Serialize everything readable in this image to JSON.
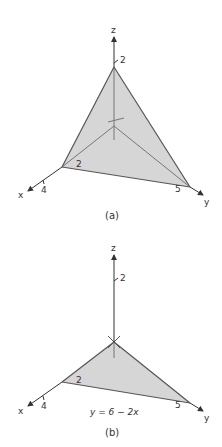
{
  "figure_a": {
    "caption": "(a)",
    "axes": {
      "x_label": "x",
      "y_label": "y",
      "z_label": "z"
    },
    "ticks": {
      "x": "4",
      "x_inner": "2",
      "y": "5",
      "z": "2"
    },
    "region": "tetrahedron bounded by coordinate planes and plane through (3,0,0),(0,6,0),(0,0,2)",
    "fill_color": "#d6d6d6",
    "edge_color": "#555555"
  },
  "figure_b": {
    "caption": "(b)",
    "axes": {
      "x_label": "x",
      "y_label": "y",
      "z_label": "z"
    },
    "ticks": {
      "x": "4",
      "x_inner": "2",
      "y": "5",
      "z": "2"
    },
    "equation": "y = 6 − 2x",
    "region": "triangular base in xy-plane",
    "fill_color": "#d6d6d6",
    "edge_color": "#555555"
  }
}
